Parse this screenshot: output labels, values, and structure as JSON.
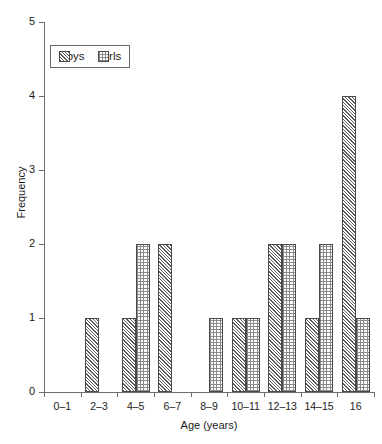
{
  "chart_data": {
    "type": "bar",
    "title": "",
    "xlabel": "Age (years)",
    "ylabel": "Frequency",
    "categories": [
      "0–1",
      "2–3",
      "4–5",
      "6–7",
      "8–9",
      "10–11",
      "12–13",
      "14–15",
      "16"
    ],
    "series": [
      {
        "name": "Boys",
        "values": [
          0,
          1,
          1,
          2,
          0,
          1,
          2,
          1,
          4
        ]
      },
      {
        "name": "Girls",
        "values": [
          0,
          0,
          2,
          0,
          1,
          1,
          2,
          2,
          1
        ]
      }
    ],
    "ylim": [
      0,
      5
    ],
    "yticks": [
      0,
      1,
      2,
      3,
      4,
      5
    ],
    "ytick_labels": [
      "0",
      "1",
      "2",
      "3",
      "4",
      "5"
    ],
    "grid": false,
    "legend_position": "upper left",
    "legend_entries": [
      "Boys",
      "Girls"
    ]
  },
  "legend": {
    "boys_label": "Boys",
    "girls_label": "Girls",
    "boys_swatch_icon": "diagonal-hatch-swatch",
    "girls_swatch_icon": "dotted-grid-swatch"
  },
  "axes": {
    "y_title": "Frequency",
    "x_title": "Age (years)"
  },
  "style": {
    "boys_pattern_color": "#5c5c5c",
    "girls_pattern_color": "#8a8a8a",
    "bar_border_color": "#4a4a4a",
    "axis_color": "#6e6e6e",
    "text_color": "#1a1a1a",
    "background": "#ffffff"
  }
}
